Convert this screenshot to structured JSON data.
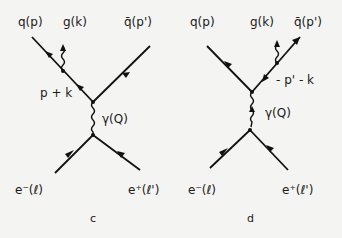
{
  "diagrams": [
    {
      "id": "c",
      "caption": "c",
      "labels": {
        "quark": "q(p)",
        "gluon": "g(k)",
        "antiquark": "q̄(p')",
        "internal_momentum": "p + k",
        "photon": "γ(Q)",
        "electron": "e⁻(ℓ)",
        "positron": "e⁺(ℓ')"
      }
    },
    {
      "id": "d",
      "caption": "d",
      "labels": {
        "quark": "q(p)",
        "gluon": "g(k)",
        "antiquark": "q̄(p')",
        "internal_momentum": "- p' - k",
        "photon": "γ(Q)",
        "electron": "e⁻(ℓ)",
        "positron": "e⁺(ℓ')"
      }
    }
  ]
}
